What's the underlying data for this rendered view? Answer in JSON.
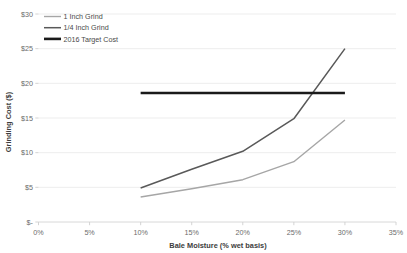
{
  "chart_data": {
    "type": "line",
    "title": "",
    "xlabel": "Bale Moisture (% wet basis)",
    "ylabel": "Grinding Cost ($)",
    "xlim": [
      0,
      35
    ],
    "ylim": [
      0,
      30
    ],
    "grid": true,
    "legend_position": "top-left",
    "x_tick_labels": [
      "0%",
      "5%",
      "10%",
      "15%",
      "20%",
      "25%",
      "30%",
      "35%"
    ],
    "x_tick_values": [
      0,
      5,
      10,
      15,
      20,
      25,
      30,
      35
    ],
    "y_tick_labels": [
      "$-",
      "$5",
      "$10",
      "$15",
      "$20",
      "$25",
      "$30"
    ],
    "y_tick_values": [
      0,
      5,
      10,
      15,
      20,
      25,
      30
    ],
    "series": [
      {
        "name": "1 Inch Grind",
        "color": "#a6a6a6",
        "width": 1.4,
        "x": [
          10,
          15,
          20,
          25,
          30
        ],
        "values": [
          3.6,
          4.8,
          6.1,
          8.7,
          14.7
        ]
      },
      {
        "name": "1/4 Inch Grind",
        "color": "#595959",
        "width": 1.5,
        "x": [
          10,
          15,
          20,
          25,
          30
        ],
        "values": [
          4.9,
          7.6,
          10.2,
          14.9,
          25.0
        ]
      },
      {
        "name": "2016 Target Cost",
        "color": "#1a1a1a",
        "width": 2.6,
        "x": [
          10,
          30
        ],
        "values": [
          18.6,
          18.6
        ]
      }
    ]
  },
  "legend": {
    "items": [
      {
        "label": "1 Inch Grind"
      },
      {
        "label": "1/4 Inch Grind"
      },
      {
        "label": "2016 Target Cost"
      }
    ]
  }
}
